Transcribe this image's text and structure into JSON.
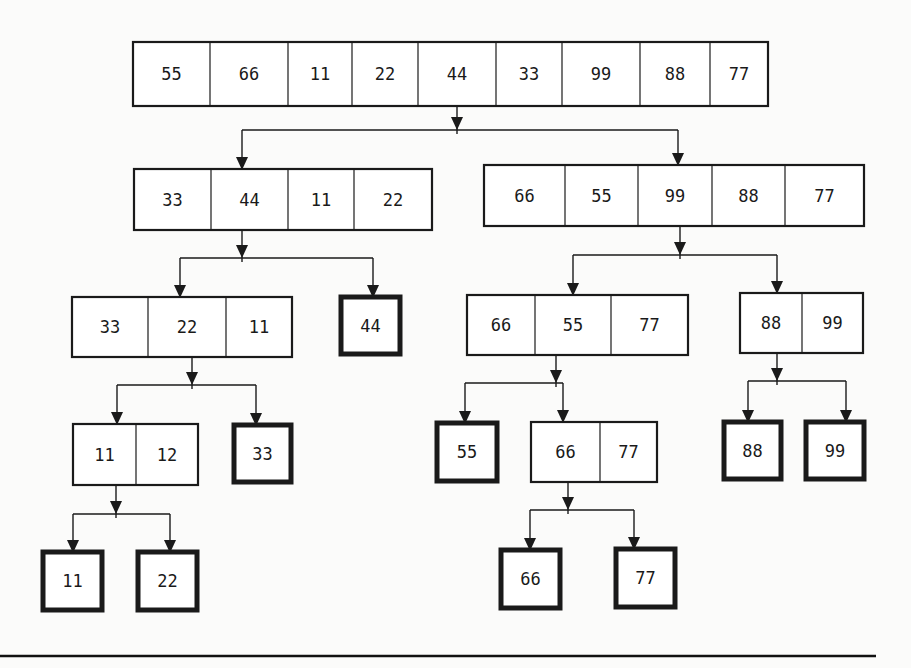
{
  "diagram": {
    "nodes": [
      {
        "id": "root",
        "values": [
          "55",
          "66",
          "11",
          "22",
          "44",
          "33",
          "99",
          "88",
          "77"
        ],
        "leaf": false
      },
      {
        "id": "L",
        "values": [
          "33",
          "44",
          "11",
          "22"
        ],
        "leaf": false
      },
      {
        "id": "R",
        "values": [
          "66",
          "55",
          "99",
          "88",
          "77"
        ],
        "leaf": false
      },
      {
        "id": "LL",
        "values": [
          "33",
          "22",
          "11"
        ],
        "leaf": false
      },
      {
        "id": "LR",
        "values": [
          "44"
        ],
        "leaf": true
      },
      {
        "id": "RL",
        "values": [
          "66",
          "55",
          "77"
        ],
        "leaf": false
      },
      {
        "id": "RR",
        "values": [
          "88",
          "99"
        ],
        "leaf": false
      },
      {
        "id": "LLL",
        "values": [
          "11",
          "12"
        ],
        "leaf": false
      },
      {
        "id": "LLR",
        "values": [
          "33"
        ],
        "leaf": true
      },
      {
        "id": "RLL",
        "values": [
          "55"
        ],
        "leaf": true
      },
      {
        "id": "RLR",
        "values": [
          "66",
          "77"
        ],
        "leaf": false
      },
      {
        "id": "RRL",
        "values": [
          "88"
        ],
        "leaf": true
      },
      {
        "id": "RRR",
        "values": [
          "99"
        ],
        "leaf": true
      },
      {
        "id": "LLLL",
        "values": [
          "11"
        ],
        "leaf": true
      },
      {
        "id": "LLLR",
        "values": [
          "22"
        ],
        "leaf": true
      },
      {
        "id": "RLRL",
        "values": [
          "66"
        ],
        "leaf": true
      },
      {
        "id": "RLRR",
        "values": [
          "77"
        ],
        "leaf": true
      }
    ],
    "edges": [
      {
        "from": "root",
        "to": [
          "L",
          "R"
        ]
      },
      {
        "from": "L",
        "to": [
          "LL",
          "LR"
        ]
      },
      {
        "from": "R",
        "to": [
          "RL",
          "RR"
        ]
      },
      {
        "from": "LL",
        "to": [
          "LLL",
          "LLR"
        ]
      },
      {
        "from": "RL",
        "to": [
          "RLL",
          "RLR"
        ]
      },
      {
        "from": "RR",
        "to": [
          "RRL",
          "RRR"
        ]
      },
      {
        "from": "LLL",
        "to": [
          "LLLL",
          "LLLR"
        ]
      },
      {
        "from": "RLR",
        "to": [
          "RLRL",
          "RLRR"
        ]
      }
    ]
  }
}
